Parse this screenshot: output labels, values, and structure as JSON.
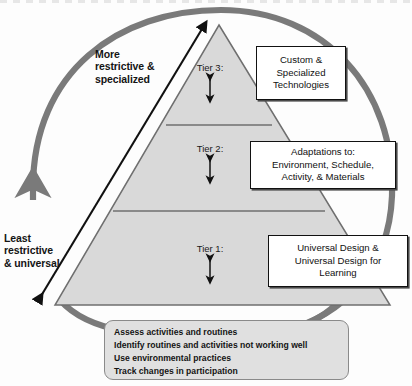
{
  "diagram": {
    "type": "tiered-pyramid-with-cycle",
    "pyramid": {
      "tiers": [
        {
          "id": "tier3",
          "label": "Tier 3:",
          "callout": "Custom &\nSpecialized\nTechnologies"
        },
        {
          "id": "tier2",
          "label": "Tier 2:",
          "callout": "Adaptations to:\nEnvironment, Schedule,\nActivity, & Materials"
        },
        {
          "id": "tier1",
          "label": "Tier 1:",
          "callout": "Universal Design &\nUniversal Design for\nLearning"
        }
      ],
      "fill_color": "#d9d9d9",
      "edge_color": "#6f6f6f"
    },
    "axis_labels": {
      "top": "More\nrestrictive &\nspecialized",
      "bottom": "Least\nrestrictive\n& universal"
    },
    "bottom_box": {
      "lines": [
        "Assess activities and routines",
        "Identify routines and activities not working well",
        "Use environmental practices",
        "Track changes in participation"
      ],
      "fill_color": "#e0e0e0",
      "border_color": "#8a8a8a"
    },
    "cycle_arrow": {
      "color": "#7a7a7a",
      "direction": "counter-clockwise",
      "description": "grey circular arrow surrounding the pyramid, arrowhead pointing up on the left side"
    },
    "continuum_arrow": {
      "color": "#111111",
      "description": "black double-headed diagonal arrow along the left face of the pyramid"
    },
    "tier_span_arrows": {
      "color": "#111111",
      "description": "small vertical double-headed arrow under each tier label"
    }
  }
}
